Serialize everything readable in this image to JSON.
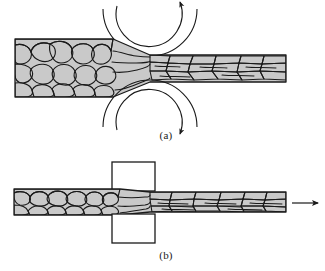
{
  "figure": {
    "width": 325,
    "height": 271,
    "background_color": "#ffffff"
  },
  "colors": {
    "grain_fill": "#c9c9c9",
    "grain_outline": "#1a1a1a",
    "workpiece_outline": "#1a1a1a",
    "roller_line": "#1a1a1a",
    "arrow_color": "#1a1a1a",
    "die_fill": "#ffffff",
    "die_outline": "#1a1a1a",
    "label_color": "#1a1a1a"
  },
  "panels": [
    {
      "id": "panel-a",
      "label": "(a)",
      "label_x": 166,
      "label_y": 136,
      "process": "rolling",
      "description": "Metal slab with equiaxed grains passes between two counter-rotating rollers and emerges as a thin strip with elongated grains",
      "workpiece": {
        "entry_thickness_px": 58,
        "exit_thickness_px": 26,
        "entry_left_x": 15,
        "exit_right_x": 286,
        "centerline_y": 68
      },
      "rollers": [
        {
          "id": "roller-top",
          "center_x": 150,
          "center_y": 9,
          "outer_radius": 47,
          "inner_arrow_radius": 33,
          "rotation": "clockwise",
          "arrowhead_at": "right"
        },
        {
          "id": "roller-bottom",
          "center_x": 150,
          "center_y": 127,
          "outer_radius": 47,
          "inner_arrow_radius": 33,
          "rotation": "clockwise",
          "arrowhead_at": "right"
        }
      ]
    },
    {
      "id": "panel-b",
      "label": "(b)",
      "label_x": 166,
      "label_y": 256,
      "process": "drawing",
      "description": "Metal bar with equiaxed grains is pulled through a die, reducing its cross-section and elongating the grains",
      "workpiece": {
        "entry_thickness_px": 26,
        "exit_thickness_px": 20,
        "entry_left_x": 14,
        "exit_right_x": 286,
        "centerline_y": 202
      },
      "die": {
        "upper_block": {
          "x": 112,
          "y": 162,
          "width": 43,
          "height": 29
        },
        "lower_block": {
          "x": 112,
          "y": 214,
          "width": 43,
          "height": 29
        }
      },
      "pull_arrow": {
        "id": "draw-direction-arrow",
        "x_start": 292,
        "x_end": 320,
        "y": 203,
        "direction": "right",
        "meaning": "drawing force / pull direction"
      }
    }
  ],
  "grains": {
    "equiaxed_region_note": "Coarse roughly equiaxed polygonal grains in the undeformed portion",
    "elongated_region_note": "Grains flattened and elongated parallel to the rolling/drawing direction"
  }
}
